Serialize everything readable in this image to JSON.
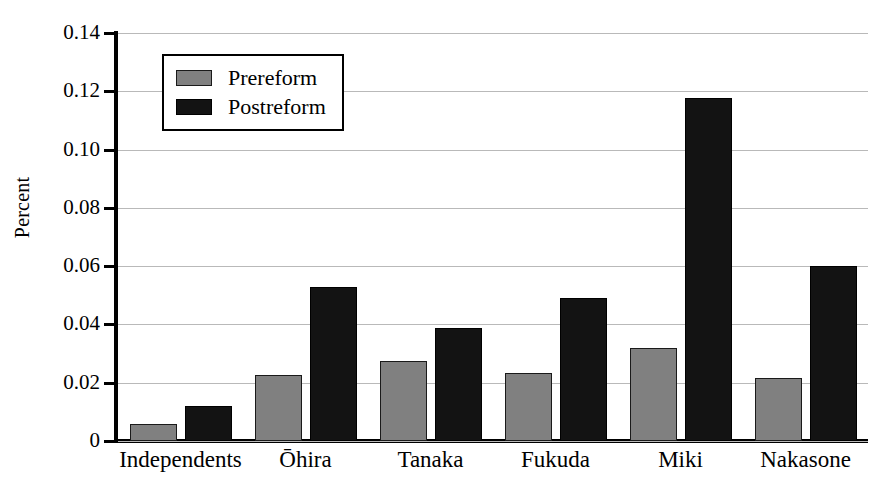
{
  "chart_data": {
    "type": "bar",
    "title": "",
    "xlabel": "",
    "ylabel": "Percent",
    "categories": [
      "Independents",
      "Ōhira",
      "Tanaka",
      "Fukuda",
      "Miki",
      "Nakasone"
    ],
    "series": [
      {
        "name": "Prereform",
        "color": "#808080",
        "values": [
          0.006,
          0.0225,
          0.0275,
          0.0233,
          0.0318,
          0.0215
        ]
      },
      {
        "name": "Postreform",
        "color": "#131313",
        "values": [
          0.012,
          0.053,
          0.0388,
          0.0492,
          0.1178,
          0.06
        ]
      }
    ],
    "ylim": [
      0,
      0.14
    ],
    "yticks": [
      "0",
      "0.02",
      "0.04",
      "0.06",
      "0.08",
      "0.10",
      "0.12",
      "0.14"
    ],
    "ytick_values": [
      0,
      0.02,
      0.04,
      0.06,
      0.08,
      0.1,
      0.12,
      0.14
    ],
    "grid": true,
    "legend_position": "upper-left-inside"
  },
  "legend": {
    "entries": [
      {
        "label": "Prereform"
      },
      {
        "label": "Postreform"
      }
    ]
  }
}
